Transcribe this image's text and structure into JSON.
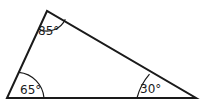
{
  "diagram": {
    "type": "triangle",
    "vertices": {
      "top": {
        "x": 47,
        "y": 11
      },
      "bottom_left": {
        "x": 7,
        "y": 98
      },
      "bottom_right": {
        "x": 196,
        "y": 98
      }
    },
    "angles": [
      {
        "vertex": "top",
        "label": "85°"
      },
      {
        "vertex": "bottom_left",
        "label": "65°"
      },
      {
        "vertex": "bottom_right",
        "label": "30°"
      }
    ],
    "stroke_color": "#1a1a1a"
  }
}
